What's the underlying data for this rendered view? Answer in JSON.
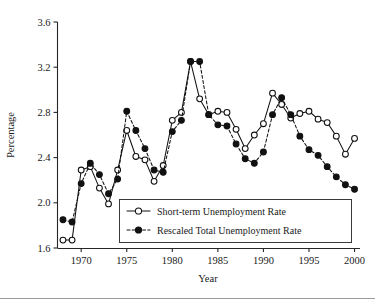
{
  "chart_data": {
    "type": "line",
    "title": "",
    "xlabel": "Year",
    "ylabel": "Percentage",
    "xlim": [
      1967.4,
      2000.6
    ],
    "ylim": [
      1.6,
      3.6
    ],
    "grid": false,
    "legend_position": "inside-lower-center-left",
    "xticks": [
      1970,
      1975,
      1980,
      1985,
      1990,
      1995,
      2000
    ],
    "xtick_labels": [
      "1970",
      "1975",
      "1980",
      "1985",
      "1990",
      "1995",
      "2000"
    ],
    "yticks": [
      1.6,
      2.0,
      2.4,
      2.8,
      3.2,
      3.6
    ],
    "ytick_labels": [
      "1.6",
      "2.0",
      "2.4",
      "2.8",
      "3.2",
      "3.6"
    ],
    "x": [
      1968,
      1969,
      1970,
      1971,
      1972,
      1973,
      1974,
      1975,
      1976,
      1977,
      1978,
      1979,
      1980,
      1981,
      1982,
      1983,
      1984,
      1985,
      1986,
      1987,
      1988,
      1989,
      1990,
      1991,
      1992,
      1993,
      1994,
      1995,
      1996,
      1997,
      1998,
      1999,
      2000
    ],
    "series": [
      {
        "name": "Short-term Unemployment Rate",
        "marker": "open-circle",
        "linestyle": "solid",
        "color": "#111111",
        "values": [
          1.67,
          1.67,
          2.29,
          2.32,
          2.13,
          1.99,
          2.29,
          2.64,
          2.41,
          2.38,
          2.19,
          2.33,
          2.73,
          2.8,
          3.25,
          2.92,
          2.78,
          2.81,
          2.8,
          2.65,
          2.48,
          2.6,
          2.7,
          2.97,
          2.87,
          2.75,
          2.79,
          2.81,
          2.74,
          2.71,
          2.59,
          2.43,
          2.57
        ]
      },
      {
        "name": "Rescaled Total Unemployment Rate",
        "marker": "filled-circle",
        "linestyle": "dashed",
        "color": "#111111",
        "values": [
          1.85,
          1.83,
          2.17,
          2.35,
          2.25,
          2.08,
          2.21,
          2.81,
          2.64,
          2.48,
          2.29,
          2.27,
          2.63,
          2.73,
          3.25,
          3.25,
          2.78,
          2.69,
          2.68,
          2.52,
          2.39,
          2.35,
          2.45,
          2.78,
          2.93,
          2.78,
          2.59,
          2.47,
          2.42,
          2.32,
          2.23,
          2.16,
          2.12
        ]
      }
    ]
  },
  "axes": {
    "y_title": "Percentage",
    "x_title": "Year"
  },
  "legend": {
    "entries": [
      {
        "label": "Short-term Unemployment Rate",
        "marker": "open-circle",
        "linestyle": "solid"
      },
      {
        "label": "Rescaled Total Unemployment Rate",
        "marker": "filled-circle",
        "linestyle": "dashed"
      }
    ]
  }
}
